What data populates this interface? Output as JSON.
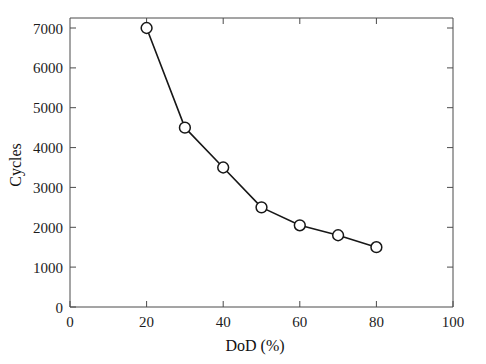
{
  "chart_data": {
    "type": "line",
    "title": "",
    "subtitle": "",
    "xlabel": "DoD (%)",
    "ylabel": "Cycles",
    "xlim": [
      0,
      100
    ],
    "ylim": [
      0,
      7500
    ],
    "grid": false,
    "legend": null,
    "marker": "open-circle",
    "line_color": "#171717",
    "marker_fill": "#ffffff",
    "background": "#ffffff",
    "x": [
      20,
      30,
      40,
      50,
      60,
      70,
      80
    ],
    "y": [
      7000,
      4500,
      3500,
      2500,
      2050,
      1800,
      1500
    ],
    "series": [
      {
        "name": "Cycles vs DoD",
        "x": [
          20,
          30,
          40,
          50,
          60,
          70,
          80
        ],
        "values": [
          7000,
          4500,
          3500,
          2500,
          2050,
          1800,
          1500
        ]
      }
    ],
    "xticks": [
      0,
      20,
      40,
      60,
      80,
      100
    ],
    "xtick_labels": [
      "0",
      "20",
      "40",
      "60",
      "80",
      "100"
    ],
    "yticks": [
      0,
      1000,
      2000,
      3000,
      4000,
      5000,
      6000,
      7000
    ],
    "ytick_labels": [
      "0",
      "1000",
      "2000",
      "3000",
      "4000",
      "5000",
      "6000",
      "7000"
    ]
  },
  "axes": {
    "x_title": "DoD (%)",
    "y_title": "Cycles"
  },
  "xticks": {
    "t0": "0",
    "t1": "20",
    "t2": "40",
    "t3": "60",
    "t4": "80",
    "t5": "100"
  },
  "yticks": {
    "t0": "0",
    "t1": "1000",
    "t2": "2000",
    "t3": "3000",
    "t4": "4000",
    "t5": "5000",
    "t6": "6000",
    "t7": "7000"
  }
}
